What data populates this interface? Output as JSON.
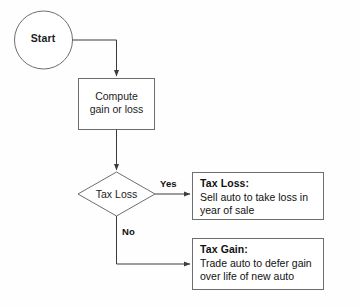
{
  "diagram": {
    "stroke_color": "#6e6e6e",
    "arrow_color": "#3b3b3b",
    "text_color": "#1c1c1c",
    "background_color": "#fefefe",
    "nodes": {
      "start": {
        "shape": "circle",
        "label": "Start"
      },
      "process": {
        "shape": "rectangle",
        "label": "Compute\ngain or loss"
      },
      "decision": {
        "shape": "diamond",
        "label": "Tax Loss"
      },
      "outcome_loss": {
        "shape": "rectangle",
        "title": "Tax Loss:",
        "body": "Sell auto to take loss in\nyear of sale"
      },
      "outcome_gain": {
        "shape": "rectangle",
        "title": "Tax Gain:",
        "body": "Trade auto to defer gain\nover life of new auto"
      }
    },
    "edges": {
      "start_to_process": {
        "label": ""
      },
      "process_to_decision": {
        "label": ""
      },
      "decision_yes": {
        "label": "Yes"
      },
      "decision_no": {
        "label": "No"
      }
    }
  }
}
